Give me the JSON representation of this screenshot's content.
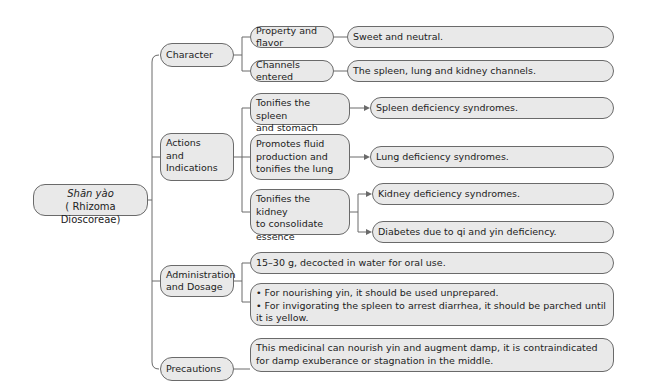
{
  "root": {
    "title": "Shān yào",
    "subtitle": "( Rhizoma Dioscoreae)"
  },
  "categories": [
    {
      "label": "Character"
    },
    {
      "label": "Actions\nand\nIndications"
    },
    {
      "label": "Administration\nand Dosage"
    },
    {
      "label": "Precautions"
    }
  ],
  "character": {
    "items": [
      {
        "label": "Property and flavor",
        "value": "Sweet and neutral."
      },
      {
        "label": "Channels entered",
        "value": "The spleen, lung and kidney channels."
      }
    ]
  },
  "actions": {
    "items": [
      {
        "label": "Tonifies the spleen\nand stomach",
        "results": [
          "Spleen deficiency syndromes."
        ]
      },
      {
        "label": "Promotes fluid\nproduction and\ntonifies the lung",
        "results": [
          "Lung deficiency syndromes."
        ]
      },
      {
        "label": "Tonifies the kidney\nto consolidate\nessence",
        "results": [
          "Kidney deficiency syndromes.",
          "Diabetes due to qi and yin deficiency."
        ]
      }
    ]
  },
  "administration": {
    "dosage": "15–30 g, decocted in water for oral use.",
    "notes": "• For nourishing yin, it should be used unprepared.\n• For invigorating the spleen to arrest diarrhea, it should be parched until it is yellow."
  },
  "precautions": {
    "text": "This medicinal can nourish yin and augment damp, it is contraindicated for damp exuberance or stagnation in the middle."
  }
}
